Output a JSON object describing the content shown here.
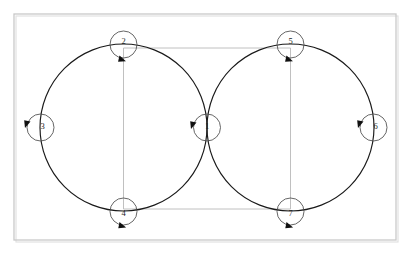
{
  "figure": {
    "title": "",
    "background_color": "#ffffff",
    "frame_color": "#c9c9c9",
    "curve_color": "#1a1a1a",
    "connector_color": "#b9b9b9",
    "node_stroke_color": "#4a4a4a",
    "arrow_color": "#101010"
  },
  "frame": {
    "x": 14,
    "y": 14,
    "width": 382,
    "height": 226
  },
  "big_circles": [
    {
      "name": "left-loop",
      "cx": 123.5,
      "cy": 127.5,
      "r": 83.5
    },
    {
      "name": "right-loop",
      "cx": 290.5,
      "cy": 127.5,
      "r": 83.5
    }
  ],
  "nodes": [
    {
      "id": "1",
      "label": "1",
      "cx": 207,
      "cy": 127.5,
      "r": 13.5,
      "label_dx": 0,
      "label_dy": 0
    },
    {
      "id": "2",
      "label": "2",
      "cx": 123.5,
      "cy": 44.5,
      "r": 13.5,
      "label_dx": 0,
      "label_dy": -2
    },
    {
      "id": "3",
      "label": "3",
      "cx": 40.5,
      "cy": 127.5,
      "r": 13.5,
      "label_dx": 2,
      "label_dy": 0
    },
    {
      "id": "4",
      "label": "4",
      "cx": 123.5,
      "cy": 211.5,
      "r": 13.5,
      "label_dx": 0,
      "label_dy": 3
    },
    {
      "id": "5",
      "label": "5",
      "cx": 290.5,
      "cy": 44.5,
      "r": 13.5,
      "label_dx": 0,
      "label_dy": -2
    },
    {
      "id": "6",
      "label": "6",
      "cx": 373.5,
      "cy": 127.5,
      "r": 13.5,
      "label_dx": 2,
      "label_dy": 0
    },
    {
      "id": "7",
      "label": "7",
      "cx": 290.5,
      "cy": 211.5,
      "r": 13.5,
      "label_dx": 0,
      "label_dy": 3
    }
  ],
  "arrows": [
    {
      "name": "arrow-node-1",
      "x": 196.5,
      "y": 122.5,
      "rotation": 108
    },
    {
      "name": "arrow-node-2",
      "x": 119.5,
      "y": 55.5,
      "rotation": 20
    },
    {
      "name": "arrow-node-3",
      "x": 30.5,
      "y": 121.5,
      "rotation": 108
    },
    {
      "name": "arrow-node-4",
      "x": 119.5,
      "y": 222.0,
      "rotation": 18
    },
    {
      "name": "arrow-node-5",
      "x": 286.5,
      "y": 55.5,
      "rotation": 20
    },
    {
      "name": "arrow-node-6",
      "x": 363.5,
      "y": 121.5,
      "rotation": 108
    },
    {
      "name": "arrow-node-7",
      "x": 286.5,
      "y": 222.0,
      "rotation": 18
    }
  ],
  "connectors": [
    {
      "name": "connector-top-horizontal",
      "x1": 123.5,
      "y1": 48.0,
      "x2": 290.5,
      "y2": 48.0
    },
    {
      "name": "connector-bottom-horizontal",
      "x1": 123.5,
      "y1": 209.0,
      "x2": 290.5,
      "y2": 209.0
    },
    {
      "name": "connector-left-vertical",
      "x1": 123.5,
      "y1": 48.0,
      "x2": 123.5,
      "y2": 209.0
    },
    {
      "name": "connector-right-vertical",
      "x1": 290.5,
      "y1": 48.0,
      "x2": 290.5,
      "y2": 209.0
    }
  ],
  "chart_data": {
    "type": "diagram",
    "node_labels": [
      "1",
      "2",
      "3",
      "4",
      "5",
      "6",
      "7"
    ],
    "loops": 2,
    "tangent_point_label": "1"
  }
}
